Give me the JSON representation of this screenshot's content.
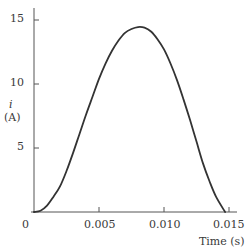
{
  "chart_data": {
    "type": "line",
    "title": "",
    "xlabel": "Time (s)",
    "ylabel": "i (A)",
    "ylabel_symbol": "i",
    "ylabel_unit": "(A)",
    "xlim": [
      0,
      0.0158
    ],
    "ylim": [
      0,
      16
    ],
    "xticks": [
      0.005,
      0.01,
      0.015
    ],
    "xtick_labels": [
      "0",
      "0.005",
      "0.010",
      "0.015"
    ],
    "yticks": [
      5,
      10,
      15
    ],
    "ytick_labels": [
      "5",
      "10",
      "15"
    ],
    "grid": false,
    "legend": null,
    "series": [
      {
        "name": "i(t)",
        "color": "#333333",
        "x": [
          0,
          0.0005,
          0.001,
          0.0015,
          0.002,
          0.0025,
          0.003,
          0.0035,
          0.004,
          0.0045,
          0.005,
          0.0055,
          0.006,
          0.0065,
          0.007,
          0.0075,
          0.008,
          0.0085,
          0.009,
          0.0095,
          0.01,
          0.0105,
          0.011,
          0.0115,
          0.012,
          0.0125,
          0.013,
          0.0135,
          0.014,
          0.0147
        ],
        "values": [
          0,
          0.1,
          0.5,
          1.2,
          2.0,
          3.2,
          4.6,
          6.1,
          7.6,
          9.0,
          10.4,
          11.6,
          12.6,
          13.4,
          14.0,
          14.3,
          14.45,
          14.4,
          14.1,
          13.5,
          12.7,
          11.6,
          10.3,
          8.8,
          7.2,
          5.5,
          3.8,
          2.4,
          1.2,
          0
        ]
      }
    ]
  }
}
